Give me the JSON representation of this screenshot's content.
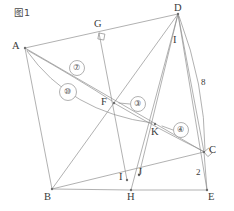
{
  "figure": {
    "caption": "图1",
    "caption_position": {
      "x": 14,
      "y": 8
    },
    "width": 234,
    "height": 211,
    "background_color": "#ffffff",
    "line_color": "#8f8f8f",
    "label_color": "#3a3a3a"
  },
  "vertices": [
    {
      "id": "A",
      "label": "A",
      "x": 25,
      "y": 48,
      "label_x": 12,
      "label_y": 41,
      "dot": true
    },
    {
      "id": "B",
      "label": "B",
      "x": 52,
      "y": 189,
      "label_x": 44,
      "label_y": 192,
      "dot": true
    },
    {
      "id": "C",
      "label": "C",
      "x": 204,
      "y": 152,
      "label_x": 209,
      "label_y": 145,
      "dot": true
    },
    {
      "id": "D",
      "label": "D",
      "x": 178,
      "y": 14,
      "label_x": 174,
      "label_y": 3,
      "dot": true
    },
    {
      "id": "E",
      "label": "E",
      "x": 207,
      "y": 190,
      "label_x": 208,
      "label_y": 192,
      "dot": true
    },
    {
      "id": "F",
      "label": "F",
      "x": 114,
      "y": 103,
      "label_x": 101,
      "label_y": 97,
      "dot": true
    },
    {
      "id": "G",
      "label": "G",
      "x": 99,
      "y": 33,
      "label_x": 94,
      "label_y": 19,
      "dot": false
    },
    {
      "id": "H",
      "label": "H",
      "x": 131,
      "y": 190,
      "label_x": 127,
      "label_y": 192,
      "dot": true
    },
    {
      "id": "I",
      "label": "I",
      "x": 127,
      "y": 180,
      "label_x": 119,
      "label_y": 172,
      "dot": true
    },
    {
      "id": "J",
      "label": "J",
      "x": 139,
      "y": 175,
      "label_x": 138,
      "label_y": 167,
      "dot": true
    },
    {
      "id": "K",
      "label": "K",
      "x": 155,
      "y": 124,
      "label_x": 151,
      "label_y": 127,
      "dot": true
    },
    {
      "id": "I2",
      "label": "I",
      "x": 176,
      "y": 40,
      "label_x": 173,
      "label_y": 35,
      "dot": false
    }
  ],
  "edges": [
    {
      "name": "edge-A-D",
      "from": "A",
      "to": "D"
    },
    {
      "name": "edge-A-B",
      "from": "A",
      "to": "B"
    },
    {
      "name": "edge-A-C",
      "from": "A",
      "to": "C"
    },
    {
      "name": "edge-B-H",
      "from": "B",
      "to": "H"
    },
    {
      "name": "edge-H-E",
      "from": "H",
      "to": "E"
    },
    {
      "name": "edge-B-D",
      "from": "B",
      "to": "D"
    },
    {
      "name": "edge-B-C",
      "from": "B",
      "to": "C"
    },
    {
      "name": "edge-D-C",
      "from": "D",
      "to": "C"
    },
    {
      "name": "edge-D-E",
      "from": "D",
      "to": "E"
    },
    {
      "name": "edge-D-H",
      "from": "D",
      "to": "H"
    },
    {
      "name": "edge-D-J",
      "from": "D",
      "to": "J"
    },
    {
      "name": "edge-C-E",
      "from": "C",
      "to": "E"
    },
    {
      "name": "edge-G-I",
      "from": "G",
      "to": "I"
    }
  ],
  "segment_labels": [
    {
      "name": "segment-label-8",
      "text": "8",
      "x": 201,
      "y": 78
    },
    {
      "name": "segment-label-2",
      "text": "2",
      "x": 196,
      "y": 168
    }
  ],
  "right_angle_markers": [
    {
      "name": "right-angle-marker-g",
      "x": 99,
      "y": 33,
      "rotation": 11
    },
    {
      "name": "right-angle-marker-c",
      "x": 204,
      "y": 152,
      "rotation": -40
    }
  ],
  "annotations": [
    {
      "name": "annotation-7",
      "label": "⑦",
      "badge_x": 77,
      "badge_y": 68,
      "badge_r": 7.5,
      "curve": "M 27 50 Q 80 80 112 101",
      "arrow_at": "F"
    },
    {
      "name": "annotation-10",
      "label": "⑩",
      "badge_x": 68,
      "badge_y": 92,
      "badge_r": 8.5,
      "curve": "M 27 51 Q 70 112 152 123",
      "arrow_at": "K"
    },
    {
      "name": "annotation-3",
      "label": "③",
      "badge_x": 138,
      "badge_y": 104,
      "badge_r": 7.5,
      "curve": "M 130 104 L 119 103",
      "arrow_at": "F"
    },
    {
      "name": "annotation-4",
      "label": "④",
      "badge_x": 181,
      "badge_y": 130,
      "badge_r": 7.5,
      "curve": "M 173 130 L 162 126",
      "arrow_at": "K"
    }
  ],
  "extra_curves": [
    {
      "name": "curve-f-to-c",
      "path": "M 114 103 Q 160 130 203 151"
    },
    {
      "name": "curve-d-to-c-outer",
      "path": "M 179 16 Q 205 85 205 150"
    }
  ]
}
